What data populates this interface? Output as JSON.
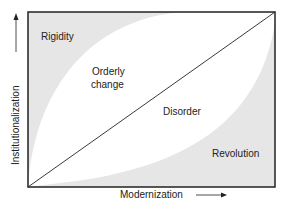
{
  "diagram": {
    "x_axis_label": "Modernization",
    "y_axis_label": "Institutionalization",
    "regions": {
      "rigidity": "Rigidity",
      "orderly_change_line1": "Orderly",
      "orderly_change_line2": "change",
      "disorder": "Disorder",
      "revolution": "Revolution"
    },
    "colors": {
      "shaded": "#e6e6e6",
      "unshaded": "#ffffff",
      "line": "#222222"
    }
  }
}
